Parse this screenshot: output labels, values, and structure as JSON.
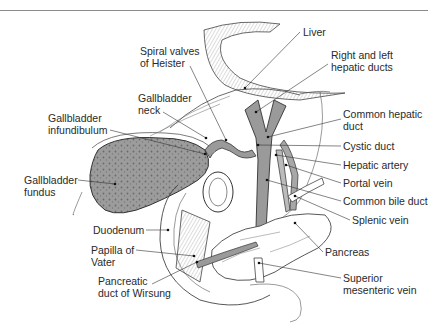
{
  "figure": {
    "type": "anatomical-illustration",
    "colors": {
      "line": "#2a2a2a",
      "fill_duct": "#9a9a9a",
      "fill_gallbladder": "#8c8c8c",
      "rule": "#8a8a8a",
      "background": "#ffffff"
    },
    "signature": "Tholly"
  },
  "labels": {
    "liver": {
      "line1": "Liver"
    },
    "hepatic_ducts": {
      "line1": "Right and left",
      "line2": "hepatic ducts"
    },
    "spiral_valves": {
      "line1": "Spiral valves",
      "line2": "of Heister"
    },
    "gallbladder_neck": {
      "line1": "Gallbladder",
      "line2": "neck"
    },
    "gallbladder_infundibulum": {
      "line1": "Gallbladder",
      "line2": "infundibulum"
    },
    "common_hepatic_duct": {
      "line1": "Common hepatic",
      "line2": "duct"
    },
    "cystic_duct": {
      "line1": "Cystic duct"
    },
    "hepatic_artery": {
      "line1": "Hepatic artery"
    },
    "portal_vein": {
      "line1": "Portal vein"
    },
    "common_bile_duct": {
      "line1": "Common bile duct"
    },
    "splenic_vein": {
      "line1": "Splenic vein"
    },
    "gallbladder_fundus": {
      "line1": "Gallbladder",
      "line2": "fundus"
    },
    "duodenum": {
      "line1": "Duodenum"
    },
    "papilla_of_vater": {
      "line1": "Papilla of",
      "line2": "Vater"
    },
    "pancreas": {
      "line1": "Pancreas"
    },
    "pancreatic_duct": {
      "line1": "Pancreatic",
      "line2": "duct of Wirsung"
    },
    "superior_mesenteric_vein": {
      "line1": "Superior",
      "line2": "mesenteric vein"
    }
  }
}
